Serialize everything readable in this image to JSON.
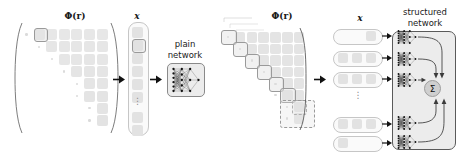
{
  "figure": {
    "title_left_matrix": "Φ(r)",
    "title_left_vector": "x",
    "title_right_matrix": "Φ(r)",
    "title_right_vector": "x",
    "plain_network_label_line1": "plain",
    "plain_network_label_line2": "network",
    "structured_network_label_line1": "structured",
    "structured_network_label_line2": "network",
    "sigma_symbol": "Σ",
    "ellipsis_vertical": "⋮",
    "colors": {
      "cell_fill": "#e2e2e2",
      "highlight_stroke": "#9a9a9a",
      "box_stroke": "#5a5a5a",
      "box_fill": "#ececec",
      "node_fill": "#1a1a1a",
      "sigma_fill": "#cfcfcf",
      "text": "#1a1a1a",
      "background": "#ffffff"
    }
  },
  "left_panel": {
    "name": "plain-network-pipeline",
    "matrix": {
      "label": "Φ(r)",
      "rows": 8,
      "cols": 7,
      "shape": "lower-triangular-row-staircase",
      "row_filled_counts": [
        6,
        5,
        4,
        3,
        2,
        2,
        1,
        1
      ],
      "highlighted_cell": {
        "row": 0,
        "col": 1
      },
      "leading_dot_per_row": true
    },
    "vector": {
      "label": "x",
      "entries": 9,
      "highlighted_entry_index": 1,
      "has_vertical_ellipsis": true,
      "ellipsis_after_entry": 5
    },
    "network": {
      "label_line1": "plain",
      "label_line2": "network",
      "type": "fully-connected-mlp",
      "layers": [
        6,
        5,
        3,
        1
      ]
    },
    "arrows": 2
  },
  "right_panel": {
    "name": "structured-network-pipeline",
    "matrix": {
      "label": "Φ(r)",
      "rows": 8,
      "cols": 7,
      "shape": "lower-triangular-row-staircase",
      "stacked_layers": true,
      "highlight_blocks_on_diagonal": 7,
      "dashed_block_index": 6,
      "leading_dot_per_row": true
    },
    "vectors": {
      "label": "x",
      "pills": [
        {
          "index": 0,
          "cells": 1,
          "cell_align": "right"
        },
        {
          "index": 1,
          "cells": 3,
          "cell_align": "spread"
        },
        {
          "index": 2,
          "cells": 3,
          "cell_align": "spread"
        },
        {
          "index": 3,
          "cells": 0,
          "is_ellipsis": true
        },
        {
          "index": 4,
          "cells": 3,
          "cell_align": "spread"
        },
        {
          "index": 5,
          "cells": 1,
          "cell_align": "left"
        }
      ]
    },
    "network": {
      "label_line1": "structured",
      "label_line2": "network",
      "sub_networks": 5,
      "has_vertical_ellipsis": true,
      "aggregator": "Σ",
      "aggregator_name": "sum-node",
      "sub_network_layers": [
        6,
        5,
        3,
        1
      ]
    },
    "arrows": 1,
    "feed_arrows": 5
  }
}
